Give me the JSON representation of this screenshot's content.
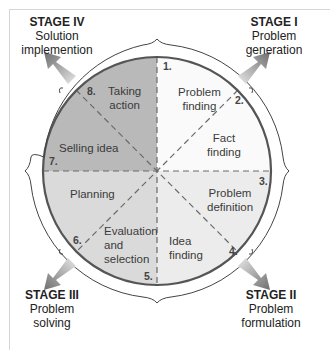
{
  "colors": {
    "stage_iv_quadrant": "#b9b9b9",
    "stage_i_quadrant": "#fafafa",
    "stage_ii_quadrant": "#ececec",
    "stage_iii_quadrant": "#dadada",
    "circle_stroke": "#555555",
    "dash": "#6a6a6a",
    "arrow_dark": "#6e6e6e",
    "arrow_light": "#e6e6e6"
  },
  "stages": [
    {
      "id": "stage-iv",
      "title": "STAGE IV",
      "lines": [
        "Solution",
        "implemention"
      ]
    },
    {
      "id": "stage-i",
      "title": "STAGE I",
      "lines": [
        "Problem",
        "generation"
      ]
    },
    {
      "id": "stage-iii",
      "title": "STAGE III",
      "lines": [
        "Problem",
        "solving"
      ]
    },
    {
      "id": "stage-ii",
      "title": "STAGE II",
      "lines": [
        "Problem",
        "formulation"
      ]
    }
  ],
  "segments": [
    {
      "number": "1.",
      "label": [
        "Problem",
        "finding"
      ]
    },
    {
      "number": "2.",
      "label": [
        "Fact",
        "finding"
      ]
    },
    {
      "number": "3.",
      "label": [
        "Problem",
        "definition"
      ]
    },
    {
      "number": "4.",
      "label": [
        "Idea",
        "finding"
      ]
    },
    {
      "number": "5.",
      "label": [
        "Evaluation",
        "and",
        "selection"
      ]
    },
    {
      "number": "6.",
      "label": [
        "Planning"
      ]
    },
    {
      "number": "7.",
      "label": [
        "Selling idea"
      ]
    },
    {
      "number": "8.",
      "label": [
        "Taking",
        "action"
      ]
    }
  ]
}
